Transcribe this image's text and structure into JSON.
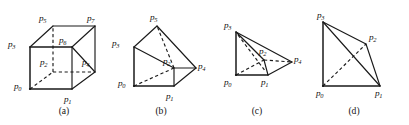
{
  "figure": {
    "background_color": "#ffffff",
    "line_color": "#1a1a1a",
    "width": 409,
    "height": 125
  },
  "panels": [
    {
      "id": "a",
      "caption": "(a)",
      "caption_x": 63,
      "caption_y": 107,
      "shape": "hexahedron-cube",
      "labels": [
        {
          "name": "p0",
          "base": "p",
          "sub": "0",
          "x": 14,
          "y": 82
        },
        {
          "name": "p1",
          "base": "p",
          "sub": "1",
          "x": 64,
          "y": 95
        },
        {
          "name": "p2",
          "base": "p",
          "sub": "2",
          "x": 44,
          "y": 58
        },
        {
          "name": "p3",
          "base": "p",
          "sub": "3",
          "x": 8,
          "y": 40
        },
        {
          "name": "p4",
          "base": "p",
          "sub": "4",
          "x": 86,
          "y": 58
        },
        {
          "name": "p5",
          "base": "p",
          "sub": "5",
          "x": 39,
          "y": 14
        },
        {
          "name": "p6",
          "base": "p",
          "sub": "6",
          "x": 58,
          "y": 36
        },
        {
          "name": "p7",
          "base": "p",
          "sub": "7",
          "x": 85,
          "y": 14
        }
      ]
    },
    {
      "id": "b",
      "caption": "(b)",
      "caption_x": 160,
      "caption_y": 107,
      "shape": "triangular-prism",
      "labels": [
        {
          "name": "p0",
          "base": "p",
          "sub": "0",
          "x": 117,
          "y": 80
        },
        {
          "name": "p1",
          "base": "p",
          "sub": "1",
          "x": 161,
          "y": 89
        },
        {
          "name": "p2",
          "base": "p",
          "sub": "2",
          "x": 170,
          "y": 58
        },
        {
          "name": "p3",
          "base": "p",
          "sub": "3",
          "x": 112,
          "y": 40
        },
        {
          "name": "p4",
          "base": "p",
          "sub": "4",
          "x": 195,
          "y": 62
        },
        {
          "name": "p5",
          "base": "p",
          "sub": "5",
          "x": 146,
          "y": 13
        }
      ]
    },
    {
      "id": "c",
      "caption": "(c)",
      "caption_x": 256,
      "caption_y": 107,
      "shape": "square-pyramid",
      "labels": [
        {
          "name": "p0",
          "base": "p",
          "sub": "0",
          "x": 219,
          "y": 81
        },
        {
          "name": "p1",
          "base": "p",
          "sub": "1",
          "x": 257,
          "y": 81
        },
        {
          "name": "p2",
          "base": "p",
          "sub": "2",
          "x": 262,
          "y": 50
        },
        {
          "name": "p3",
          "base": "p",
          "sub": "3",
          "x": 221,
          "y": 22
        },
        {
          "name": "p4",
          "base": "p",
          "sub": "4",
          "x": 294,
          "y": 56
        }
      ]
    },
    {
      "id": "d",
      "caption": "(d)",
      "caption_x": 353,
      "caption_y": 107,
      "shape": "tetrahedron",
      "labels": [
        {
          "name": "p0",
          "base": "p",
          "sub": "0",
          "x": 313,
          "y": 91
        },
        {
          "name": "p1",
          "base": "p",
          "sub": "1",
          "x": 374,
          "y": 91
        },
        {
          "name": "p2",
          "base": "p",
          "sub": "2",
          "x": 370,
          "y": 33
        },
        {
          "name": "p3",
          "base": "p",
          "sub": "3",
          "x": 316,
          "y": 12
        }
      ]
    }
  ],
  "geometry": {
    "panel_a": {
      "vertices": {
        "p0": [
          30,
          89
        ],
        "p1": [
          72,
          89
        ],
        "p2": [
          53,
          72
        ],
        "p3": [
          30,
          47
        ],
        "p4": [
          95,
          72
        ],
        "p5": [
          53,
          26
        ],
        "p6": [
          72,
          47
        ],
        "p7": [
          95,
          26
        ]
      },
      "solid_edges": [
        [
          "p0",
          "p1"
        ],
        [
          "p0",
          "p3"
        ],
        [
          "p3",
          "p5"
        ],
        [
          "p5",
          "p7"
        ],
        [
          "p7",
          "p4"
        ],
        [
          "p4",
          "p1"
        ],
        [
          "p3",
          "p6"
        ],
        [
          "p6",
          "p7"
        ],
        [
          "p1",
          "p6"
        ],
        [
          "p6",
          "p4"
        ]
      ],
      "dashed_edges": [
        [
          "p0",
          "p2"
        ],
        [
          "p2",
          "p5"
        ],
        [
          "p2",
          "p4"
        ]
      ]
    },
    "panel_b": {
      "vertices": {
        "p0": [
          134,
          86
        ],
        "p1": [
          174,
          86
        ],
        "p2": [
          174,
          68
        ],
        "p3": [
          134,
          47
        ],
        "p5": [
          157,
          26
        ],
        "p4": [
          196,
          68
        ]
      },
      "solid_edges": [
        [
          "p0",
          "p1"
        ],
        [
          "p0",
          "p3"
        ],
        [
          "p3",
          "p5"
        ],
        [
          "p5",
          "p4"
        ],
        [
          "p4",
          "p1"
        ],
        [
          "p3",
          "p2"
        ],
        [
          "p2",
          "p1"
        ],
        [
          "p2",
          "p4"
        ]
      ],
      "dashed_edges": [
        [
          "p0",
          "p2"
        ],
        [
          "p2",
          "p5"
        ]
      ]
    },
    "panel_c": {
      "vertices": {
        "p0": [
          236,
          75
        ],
        "p1": [
          268,
          75
        ],
        "p2": [
          264,
          60
        ],
        "p3": [
          236,
          32
        ],
        "p4": [
          292,
          62
        ]
      },
      "solid_edges": [
        [
          "p0",
          "p1"
        ],
        [
          "p0",
          "p3"
        ],
        [
          "p3",
          "p4"
        ],
        [
          "p4",
          "p1"
        ],
        [
          "p3",
          "p2"
        ],
        [
          "p2",
          "p1"
        ]
      ],
      "dashed_edges": [
        [
          "p0",
          "p2"
        ],
        [
          "p2",
          "p4"
        ],
        [
          "p3",
          "p1"
        ]
      ]
    },
    "panel_d": {
      "vertices": {
        "p0": [
          323,
          86
        ],
        "p1": [
          380,
          86
        ],
        "p2": [
          366,
          44
        ],
        "p3": [
          323,
          22
        ]
      },
      "solid_edges": [
        [
          "p0",
          "p1"
        ],
        [
          "p0",
          "p3"
        ],
        [
          "p3",
          "p2"
        ],
        [
          "p2",
          "p1"
        ],
        [
          "p3",
          "p1"
        ]
      ],
      "dashed_edges": [
        [
          "p0",
          "p2"
        ]
      ]
    }
  }
}
